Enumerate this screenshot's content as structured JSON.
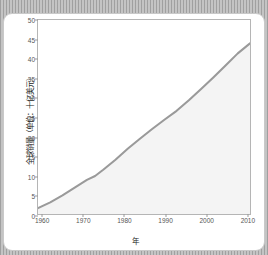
{
  "chart_data": {
    "type": "area",
    "title": "",
    "xlabel": "年",
    "ylabel": "全球销量（单位：十亿美元）",
    "xlim": [
      1959,
      2011
    ],
    "ylim": [
      0,
      50
    ],
    "grid": false,
    "legend": "none",
    "line_color": "#9a9a9a",
    "fill_color": "#f4f4f4",
    "xticks": [
      "1960",
      "1970",
      "1980",
      "1990",
      "2000",
      "2010"
    ],
    "xtick_values": [
      1960,
      1970,
      1980,
      1990,
      2000,
      2010
    ],
    "yticks": [
      "0",
      "5",
      "10",
      "15",
      "20",
      "25",
      "30",
      "35",
      "40",
      "45",
      "50"
    ],
    "ytick_values": [
      0,
      5,
      10,
      15,
      20,
      25,
      30,
      35,
      40,
      45,
      50
    ],
    "x": [
      1959,
      1962,
      1965,
      1968,
      1971,
      1973,
      1975,
      1978,
      1981,
      1984,
      1987,
      1990,
      1993,
      1996,
      1999,
      2002,
      2005,
      2008,
      2011
    ],
    "values": [
      1.5,
      3.0,
      4.8,
      6.8,
      8.8,
      9.8,
      11.4,
      14.0,
      16.8,
      19.4,
      21.9,
      24.3,
      26.6,
      29.3,
      32.2,
      35.2,
      38.3,
      41.4,
      44.0
    ],
    "series": [
      {
        "name": "全球销量",
        "values": [
          1.5,
          3.0,
          4.8,
          6.8,
          8.8,
          9.8,
          11.4,
          14.0,
          16.8,
          19.4,
          21.9,
          24.3,
          26.6,
          29.3,
          32.2,
          35.2,
          38.3,
          41.4,
          44.0
        ]
      }
    ]
  }
}
